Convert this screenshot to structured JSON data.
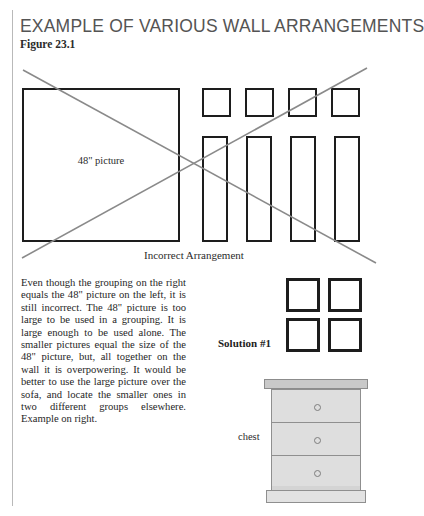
{
  "page": {
    "title": "EXAMPLE OF VARIOUS WALL ARRANGEMENTS",
    "figure_number": "Figure 23.1",
    "background_color": "#ffffff",
    "rule_color": "#b9b9b9"
  },
  "incorrect_arrangement": {
    "caption": "Incorrect Arrangement",
    "large_picture_label": "48\" picture",
    "frame_color": "#1d1d1d",
    "x_mark_color": "#8a8a8a",
    "large_frame": {
      "x": 22,
      "y": 88,
      "w": 158,
      "h": 154
    },
    "small_squares": [
      {
        "x": 202,
        "y": 88,
        "w": 29,
        "h": 29
      },
      {
        "x": 245,
        "y": 88,
        "w": 29,
        "h": 29
      },
      {
        "x": 288,
        "y": 88,
        "w": 29,
        "h": 29
      },
      {
        "x": 331,
        "y": 88,
        "w": 29,
        "h": 29
      }
    ],
    "tall_rectangles": [
      {
        "x": 202,
        "y": 136,
        "w": 26,
        "h": 106
      },
      {
        "x": 246,
        "y": 136,
        "w": 26,
        "h": 106
      },
      {
        "x": 290,
        "y": 136,
        "w": 26,
        "h": 106
      },
      {
        "x": 334,
        "y": 136,
        "w": 26,
        "h": 106
      }
    ],
    "x_lines": [
      {
        "x1": 23,
        "y1": 70,
        "x2": 376,
        "y2": 263
      },
      {
        "x1": 22,
        "y1": 258,
        "x2": 367,
        "y2": 68
      }
    ]
  },
  "explanation": {
    "text": "Even though the grouping on the right equals the 48\" picture on the left, it is still incorrect.  The 48\" picture is too large to be used in a grouping.  It is large enough to be used alone.  The smaller pictures equal the size of the 48\" picture, but, all together on the wall it is overpowering.  It would be better to use the large picture over the sofa, and locate the smaller ones in two different groups elsewhere.  Example on right."
  },
  "solution": {
    "label": "Solution #1",
    "squares": [
      {
        "x": 286,
        "y": 278,
        "w": 34,
        "h": 34
      },
      {
        "x": 328,
        "y": 278,
        "w": 34,
        "h": 34
      },
      {
        "x": 286,
        "y": 318,
        "w": 34,
        "h": 34
      },
      {
        "x": 328,
        "y": 318,
        "w": 34,
        "h": 34
      }
    ]
  },
  "furniture": {
    "label": "chest",
    "top_color": "#c9c9c9",
    "body_color": "#dcdcdc",
    "base_color": "#e2e2e2",
    "outline_color": "#8f8f8f",
    "drawer_count": 3
  }
}
